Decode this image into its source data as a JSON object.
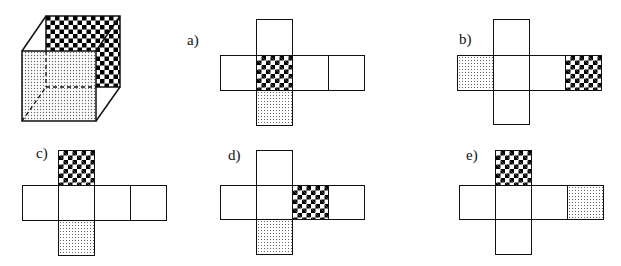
{
  "figure": {
    "cube": {
      "faces": {
        "back": "checker",
        "front": "dotted"
      }
    },
    "patterns": {
      "checker": "checker-pattern",
      "dotted": "dotted-pattern",
      "blank": "blank"
    },
    "nets": [
      {
        "label": "a)",
        "shape": "cross: top column square, 4-square middle row, bottom column square",
        "cells": [
          {
            "pos": "top",
            "fill": "blank"
          },
          {
            "pos": "row-1",
            "fill": "blank"
          },
          {
            "pos": "row-2",
            "fill": "checker"
          },
          {
            "pos": "row-3",
            "fill": "blank"
          },
          {
            "pos": "row-4",
            "fill": "blank"
          },
          {
            "pos": "bottom",
            "fill": "dotted"
          }
        ]
      },
      {
        "label": "b)",
        "shape": "cross: top column square, 4-square middle row, bottom column square",
        "cells": [
          {
            "pos": "top",
            "fill": "blank"
          },
          {
            "pos": "row-1",
            "fill": "dotted"
          },
          {
            "pos": "row-2",
            "fill": "blank"
          },
          {
            "pos": "row-3",
            "fill": "blank"
          },
          {
            "pos": "row-4",
            "fill": "checker"
          },
          {
            "pos": "bottom",
            "fill": "blank"
          }
        ]
      },
      {
        "label": "c)",
        "shape": "cross: top column square, 4-square middle row, bottom column square",
        "cells": [
          {
            "pos": "top",
            "fill": "checker"
          },
          {
            "pos": "row-1",
            "fill": "blank"
          },
          {
            "pos": "row-2",
            "fill": "blank"
          },
          {
            "pos": "row-3",
            "fill": "blank"
          },
          {
            "pos": "row-4",
            "fill": "blank"
          },
          {
            "pos": "bottom",
            "fill": "dotted"
          }
        ]
      },
      {
        "label": "d)",
        "shape": "cross: top column square, 4-square middle row, bottom column square",
        "cells": [
          {
            "pos": "top",
            "fill": "blank"
          },
          {
            "pos": "row-1",
            "fill": "blank"
          },
          {
            "pos": "row-2",
            "fill": "blank"
          },
          {
            "pos": "row-3",
            "fill": "checker"
          },
          {
            "pos": "row-4",
            "fill": "blank"
          },
          {
            "pos": "bottom",
            "fill": "dotted"
          }
        ]
      },
      {
        "label": "e)",
        "shape": "cross: top column square, 4-square middle row, bottom column square",
        "cells": [
          {
            "pos": "top",
            "fill": "checker"
          },
          {
            "pos": "row-1",
            "fill": "blank"
          },
          {
            "pos": "row-2",
            "fill": "blank"
          },
          {
            "pos": "row-3",
            "fill": "blank"
          },
          {
            "pos": "row-4",
            "fill": "dotted"
          },
          {
            "pos": "bottom",
            "fill": "blank"
          }
        ]
      }
    ],
    "colors": {
      "line": "#111111",
      "checker_dark": "#000000",
      "dot": "#666666",
      "background": "#ffffff"
    }
  }
}
